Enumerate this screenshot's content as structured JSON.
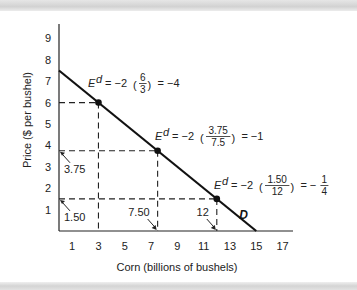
{
  "chart_data": {
    "type": "line",
    "title": "",
    "xlabel": "Corn (billions of bushels)",
    "ylabel": "Price ($ per bushel)",
    "xlim": [
      0,
      18
    ],
    "ylim": [
      0,
      9.5
    ],
    "x_ticks": [
      1,
      3,
      5,
      7,
      9,
      11,
      13,
      15,
      17
    ],
    "y_ticks": [
      1,
      2,
      3,
      4,
      5,
      6,
      7,
      8,
      9
    ],
    "grid": false,
    "series": [
      {
        "name": "D",
        "label": "D",
        "line": [
          [
            0,
            7.5
          ],
          [
            15,
            0
          ]
        ]
      }
    ],
    "points": [
      {
        "x": 3,
        "y": 6,
        "annotation": {
          "lhs": "E",
          "sup": "d",
          "coef": "= −2",
          "num": "6",
          "den": "3",
          "result": "= −4"
        }
      },
      {
        "x": 7.5,
        "y": 3.75,
        "x_callout": "7.50",
        "y_callout": "3.75",
        "annotation": {
          "lhs": "E",
          "sup": "d",
          "coef": "= −2",
          "num": "3.75",
          "den": "7.5",
          "result": "= −1"
        }
      },
      {
        "x": 12,
        "y": 1.5,
        "x_callout": "12",
        "y_callout": "1.50",
        "annotation": {
          "lhs": "E",
          "sup": "d",
          "coef": "= −2",
          "num": "1.50",
          "den": "12",
          "result": "= −",
          "result_num": "1",
          "result_den": "4"
        }
      }
    ]
  }
}
